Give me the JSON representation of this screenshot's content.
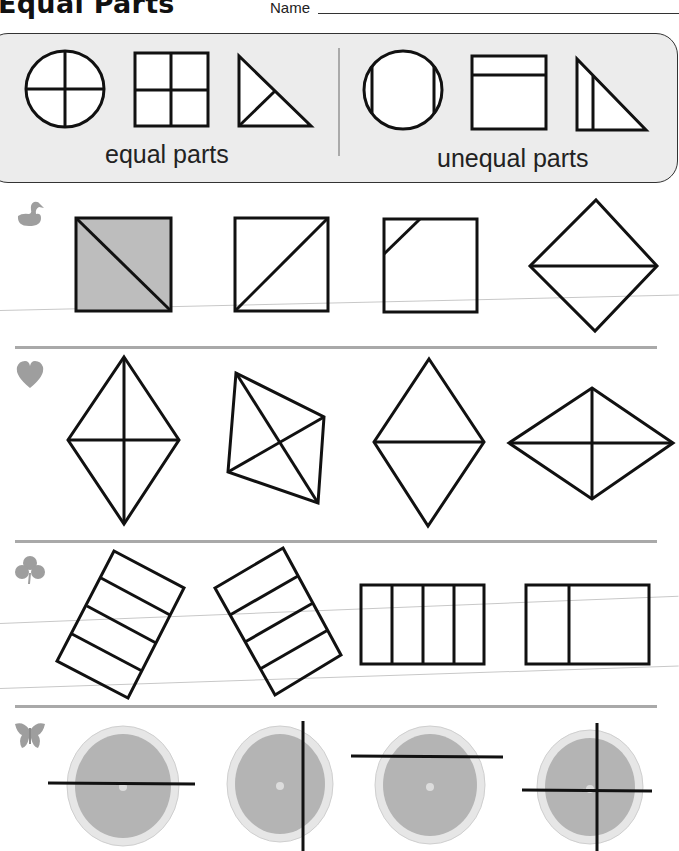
{
  "header": {
    "title": "Equal Parts",
    "name_label": "Name"
  },
  "example_panel": {
    "equal_caption": "equal parts",
    "unequal_caption": "unequal parts",
    "equal_examples": [
      "circle-quarters",
      "square-quarters",
      "triangle-halves"
    ],
    "unequal_examples": [
      "circle-unequal-strips",
      "square-unequal-strip",
      "triangle-unequal-halves"
    ]
  },
  "rows": [
    {
      "icon": "duck-icon",
      "shapes": [
        "square-diagonal-shaded",
        "square-diagonal",
        "square-corner-cut",
        "rhombus-horizontal-split"
      ]
    },
    {
      "icon": "heart-icon",
      "shapes": [
        "kite-four-parts",
        "quadrilateral-diagonals",
        "rhombus-horizontal-split",
        "rhombus-four-parts"
      ]
    },
    {
      "icon": "club-icon",
      "shapes": [
        "tilted-rectangle-four-strips",
        "tilted-rectangle-four-strips",
        "rectangle-four-strips",
        "rectangle-unequal-split"
      ]
    },
    {
      "icon": "butterfly-icon",
      "shapes": [
        "orange-horizontal-center-line",
        "orange-vertical-off-center-line",
        "orange-horizontal-top-line",
        "orange-cross-lines"
      ]
    }
  ],
  "colors": {
    "shaded_fill": "#bdbdbd",
    "panel_bg": "#ececec",
    "icon_gray": "#9e9e9e",
    "orange_rind": "#e6e6e6",
    "orange_flesh": "#b4b4b4"
  }
}
